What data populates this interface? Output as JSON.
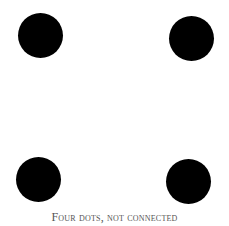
{
  "figure": {
    "dots": [
      {
        "position": "top-left",
        "color": "#000000"
      },
      {
        "position": "top-right",
        "color": "#000000"
      },
      {
        "position": "bottom-left",
        "color": "#000000"
      },
      {
        "position": "bottom-right",
        "color": "#000000"
      }
    ],
    "caption": "Four dots, not connected"
  }
}
